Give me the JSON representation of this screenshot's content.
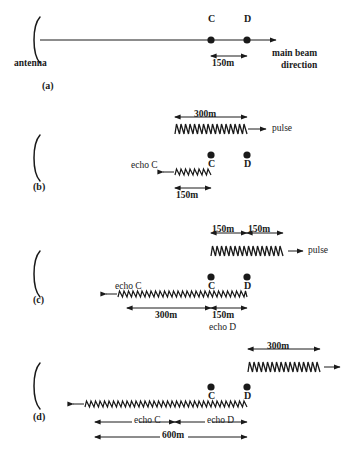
{
  "figure": {
    "background": "#ffffff",
    "ink": "#1a1a1a",
    "scale_note": "150m = 36px"
  },
  "panels": [
    {
      "id": "a",
      "label": "(a)",
      "antenna_label": "antenna",
      "point_c": "C",
      "point_d": "D",
      "dim_cd": "150m",
      "beam_label_line1": "main beam",
      "beam_label_line2": "direction"
    },
    {
      "id": "b",
      "label": "(b)",
      "pulse_dim": "300m",
      "pulse_label": "pulse",
      "point_c": "C",
      "point_d": "D",
      "echo_c_label": "echo C",
      "echo_c_dim": "150m"
    },
    {
      "id": "c",
      "label": "(c)",
      "pulse_dim_left": "150m",
      "pulse_dim_right": "150m",
      "pulse_label": "pulse",
      "point_c": "C",
      "point_d": "D",
      "echo_c_label": "echo C",
      "dim_300": "300m",
      "dim_150": "150m",
      "echo_d_label": "echo D"
    },
    {
      "id": "d",
      "label": "(d)",
      "pulse_dim": "300m",
      "point_c": "C",
      "point_d": "D",
      "echo_c_label": "echo C",
      "echo_d_label": "echo D",
      "total_dim": "600m"
    }
  ]
}
